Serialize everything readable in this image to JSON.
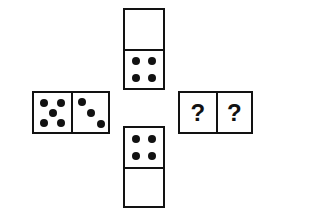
{
  "puzzle": {
    "title": "Domino cross sequence puzzle",
    "background_color": "#ffffff",
    "ink_color": "#121212",
    "pip_color": "#121212",
    "unknown_symbol": "?",
    "dominoes": [
      {
        "id": "domino-top",
        "position": "top",
        "orientation": "vertical",
        "halves": [
          {
            "id": "top-upper",
            "value": 0,
            "pip_layout": "blank",
            "pips": []
          },
          {
            "id": "top-lower",
            "value": 4,
            "pip_layout": "four-corners",
            "pips": [
              [
                30,
                28
              ],
              [
                70,
                28
              ],
              [
                30,
                72
              ],
              [
                70,
                72
              ]
            ]
          }
        ]
      },
      {
        "id": "domino-left",
        "position": "left",
        "orientation": "horizontal",
        "halves": [
          {
            "id": "left-left",
            "value": 5,
            "pip_layout": "quincunx",
            "pips": [
              [
                27,
                25
              ],
              [
                73,
                25
              ],
              [
                50,
                50
              ],
              [
                27,
                77
              ],
              [
                73,
                77
              ]
            ]
          },
          {
            "id": "left-right",
            "value": 3,
            "pip_layout": "diagonal",
            "pips": [
              [
                25,
                23
              ],
              [
                52,
                52
              ],
              [
                79,
                80
              ]
            ]
          }
        ]
      },
      {
        "id": "domino-right",
        "position": "right",
        "orientation": "horizontal",
        "halves": [
          {
            "id": "right-left",
            "value": null,
            "pip_layout": "unknown",
            "label": "?",
            "pips": []
          },
          {
            "id": "right-right",
            "value": null,
            "pip_layout": "unknown",
            "label": "?",
            "pips": []
          }
        ]
      },
      {
        "id": "domino-bottom",
        "position": "bottom",
        "orientation": "vertical",
        "halves": [
          {
            "id": "bottom-upper",
            "value": 4,
            "pip_layout": "four-corners",
            "pips": [
              [
                30,
                28
              ],
              [
                70,
                28
              ],
              [
                30,
                72
              ],
              [
                70,
                72
              ]
            ]
          },
          {
            "id": "bottom-lower",
            "value": 0,
            "pip_layout": "blank",
            "pips": []
          }
        ]
      }
    ]
  }
}
